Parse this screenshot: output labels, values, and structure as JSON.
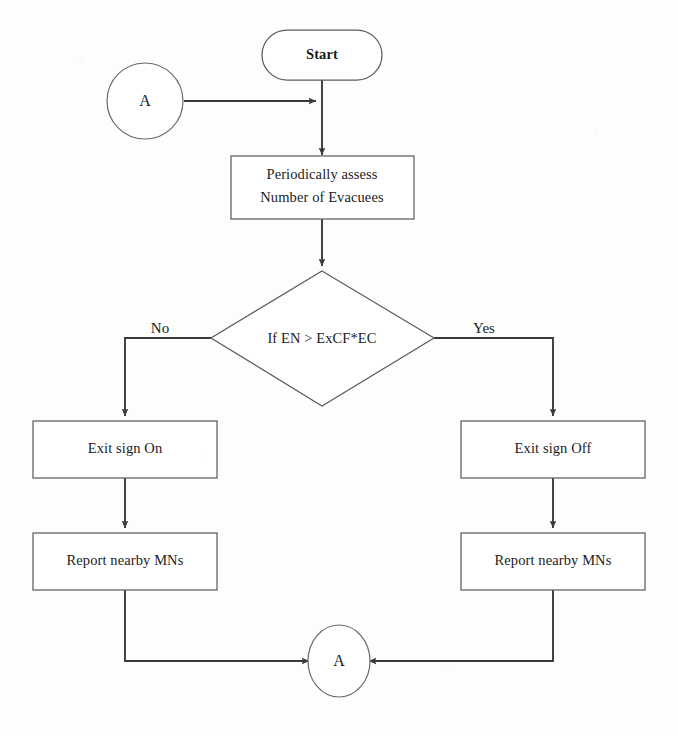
{
  "diagram": {
    "type": "flowchart",
    "background_color": "#fdfdfc",
    "line_color": "#3a3a3a",
    "shape_stroke_color": "#5d5d5d",
    "text_color": "#1c1c1c"
  },
  "nodes": {
    "start": {
      "label": "Start",
      "shape": "terminator-rounded",
      "x": 322,
      "y": 55
    },
    "connector_in": {
      "label": "A",
      "shape": "circle",
      "x": 145,
      "y": 101
    },
    "assess": {
      "label_line1": "Periodically assess",
      "label_line2": "Number of Evacuees",
      "shape": "process-rectangle",
      "x": 322,
      "y": 187
    },
    "decision": {
      "label": "If EN > ExCF*EC",
      "shape": "decision-diamond",
      "x": 322,
      "y": 338
    },
    "exit_sign_on": {
      "label": "Exit sign On",
      "shape": "process-rectangle",
      "x": 125,
      "y": 449
    },
    "exit_sign_off": {
      "label": "Exit sign Off",
      "shape": "process-rectangle",
      "x": 553,
      "y": 449
    },
    "report_left": {
      "label": "Report nearby MNs",
      "shape": "process-rectangle",
      "x": 125,
      "y": 561
    },
    "report_right": {
      "label": "Report nearby MNs",
      "shape": "process-rectangle",
      "x": 553,
      "y": 561
    },
    "connector_out": {
      "label": "A",
      "shape": "circle",
      "x": 339,
      "y": 661
    }
  },
  "branch_labels": {
    "no": {
      "label": "No",
      "x": 160,
      "y": 330
    },
    "yes": {
      "label": "Yes",
      "x": 484,
      "y": 330
    }
  },
  "edges": [
    {
      "name": "connector-in-to-start-stem",
      "from": "connector_in",
      "to": "start_stem",
      "arrow": true
    },
    {
      "name": "start-to-assess",
      "from": "start",
      "to": "assess",
      "arrow": true
    },
    {
      "name": "assess-to-decision",
      "from": "assess",
      "to": "decision",
      "arrow": true
    },
    {
      "name": "decision-no-to-exit-sign-on",
      "from": "decision",
      "to": "exit_sign_on",
      "arrow": true,
      "label": "No"
    },
    {
      "name": "decision-yes-to-exit-sign-off",
      "from": "decision",
      "to": "exit_sign_off",
      "arrow": true,
      "label": "Yes"
    },
    {
      "name": "exit-sign-on-to-report-left",
      "from": "exit_sign_on",
      "to": "report_left",
      "arrow": true
    },
    {
      "name": "exit-sign-off-to-report-right",
      "from": "exit_sign_off",
      "to": "report_right",
      "arrow": true
    },
    {
      "name": "report-left-to-connector-out",
      "from": "report_left",
      "to": "connector_out",
      "arrow": true
    },
    {
      "name": "report-right-to-connector-out",
      "from": "report_right",
      "to": "connector_out",
      "arrow": true
    }
  ]
}
